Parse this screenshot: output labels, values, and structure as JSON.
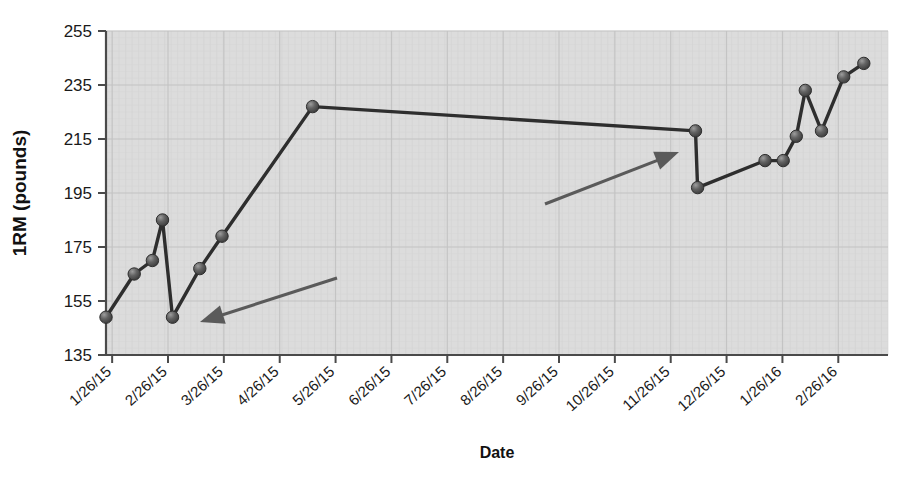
{
  "chart_data": {
    "type": "line",
    "title": "",
    "xlabel": "Date",
    "ylabel": "1RM (pounds)",
    "ylim": [
      135,
      255
    ],
    "ytick_labels": [
      "135",
      "155",
      "175",
      "195",
      "215",
      "235",
      "255"
    ],
    "ytick_values": [
      135,
      155,
      175,
      195,
      215,
      235,
      255
    ],
    "xtick_labels": [
      "1/26/15",
      "2/26/15",
      "3/26/15",
      "4/26/15",
      "5/26/15",
      "6/26/15",
      "7/26/15",
      "8/26/15",
      "9/26/15",
      "10/26/15",
      "11/26/15",
      "12/26/15",
      "1/26/16",
      "2/26/16"
    ],
    "grid": true,
    "legend": "none",
    "series": [
      {
        "name": "1RM",
        "marker": "circle",
        "color": "#4d4d4d",
        "line_color": "#333333",
        "points": [
          {
            "x": "1/26/15",
            "x_frac": 0.0,
            "y": 149
          },
          {
            "x": "2/10/15",
            "x_frac": 0.0361,
            "y": 165
          },
          {
            "x": "2/19/15",
            "x_frac": 0.0593,
            "y": 170
          },
          {
            "x": "2/24/15",
            "x_frac": 0.0722,
            "y": 185
          },
          {
            "x": "3/02/15",
            "x_frac": 0.0851,
            "y": 149
          },
          {
            "x": "3/16/15",
            "x_frac": 0.1199,
            "y": 167
          },
          {
            "x": "3/28/15",
            "x_frac": 0.1483,
            "y": 179
          },
          {
            "x": "5/15/15",
            "x_frac": 0.2642,
            "y": 227
          },
          {
            "x": "11/28/15",
            "x_frac": 0.7539,
            "y": 218
          },
          {
            "x": "12/01/15",
            "x_frac": 0.7565,
            "y": 197
          },
          {
            "x": "1/17/16",
            "x_frac": 0.8428,
            "y": 207
          },
          {
            "x": "1/25/16",
            "x_frac": 0.866,
            "y": 207
          },
          {
            "x": "1/31/16",
            "x_frac": 0.8828,
            "y": 216
          },
          {
            "x": "2/04/16",
            "x_frac": 0.8943,
            "y": 233
          },
          {
            "x": "2/11/16",
            "x_frac": 0.9149,
            "y": 218
          },
          {
            "x": "2/20/16",
            "x_frac": 0.9433,
            "y": 238
          },
          {
            "x": "2/28/16",
            "x_frac": 0.9691,
            "y": 243
          }
        ]
      }
    ],
    "annotations": [
      {
        "name": "annotation-arrow-left",
        "kind": "arrow",
        "from": {
          "x": 337,
          "y": 278
        },
        "to": {
          "x": 200,
          "y": 322
        },
        "color": "#5a5a5a"
      },
      {
        "name": "annotation-arrow-right",
        "kind": "arrow",
        "from": {
          "x": 545,
          "y": 204
        },
        "to": {
          "x": 679,
          "y": 152
        },
        "color": "#5a5a5a"
      }
    ],
    "style": {
      "plot_background": "#dcdcdc",
      "grid_color": "#c3c3c3",
      "axis_color": "#555555",
      "marker_fill": "#545454",
      "marker_highlight": "#9a9a9a",
      "line_color": "#2e2e2e"
    },
    "plot_area": {
      "left": 106,
      "top": 31,
      "right": 888,
      "bottom": 355
    }
  }
}
